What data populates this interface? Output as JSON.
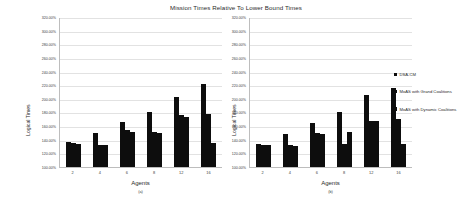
{
  "chart_data": {
    "type": "bar",
    "title": "Mission Times Relative To Lower Bound Times",
    "xlabel": "Agents",
    "ylabel": "Logical Times",
    "categories": [
      "2",
      "4",
      "6",
      "8",
      "12",
      "16"
    ],
    "ylim": [
      100,
      320
    ],
    "ytick_labels": [
      "320.00%",
      "300.00%",
      "280.00%",
      "260.00%",
      "240.00%",
      "220.00%",
      "200.00%",
      "180.00%",
      "160.00%",
      "140.00%",
      "120.00%",
      "100.00%"
    ],
    "ytick_values": [
      320,
      300,
      280,
      260,
      240,
      220,
      200,
      180,
      160,
      140,
      120,
      100
    ],
    "grid": true,
    "legend_position": "right",
    "legend": [
      "DSA-CM",
      "MoAS with Grand Coalitions",
      "MoAS with Dynamic Coalitions"
    ],
    "panels": [
      {
        "label": "(a)",
        "series": [
          {
            "name": "DSA-CM",
            "values": [
              136,
              150,
              166,
              180,
              202,
              222
            ]
          },
          {
            "name": "MoAS with Grand Coalitions",
            "values": [
              135,
              133,
              154,
              152,
              176,
              178
            ]
          },
          {
            "name": "MoAS with Dynamic Coalitions",
            "values": [
              134,
              132,
              152,
              150,
              174,
              135
            ]
          }
        ]
      },
      {
        "label": "(b)",
        "series": [
          {
            "name": "DSA-CM",
            "values": [
              134,
              148,
              164,
              180,
              206,
              216
            ]
          },
          {
            "name": "MoAS with Grand Coalitions",
            "values": [
              133,
              132,
              150,
              134,
              168,
              170
            ]
          },
          {
            "name": "MoAS with Dynamic Coalitions",
            "values": [
              132,
              131,
              149,
              152,
              167,
              134
            ]
          }
        ]
      }
    ]
  },
  "chart": {
    "title": "Mission Times Relative To Lower Bound Times",
    "xlabel": "Agents",
    "ylabel": "Logical Times",
    "panel_a_sublabel": "(a)",
    "panel_b_sublabel": "(b)",
    "series_colors": [
      "#0d0d0d",
      "#0d0d0d",
      "#0d0d0d"
    ],
    "grid_color": "#e2e2e2",
    "axis_color": "#bdbdbd"
  },
  "legend": {
    "items": [
      {
        "label": "DSA-CM"
      },
      {
        "label": "MoAS with Grand Coalitions"
      },
      {
        "label": "MoAS with Dynamic Coalitions"
      }
    ]
  }
}
